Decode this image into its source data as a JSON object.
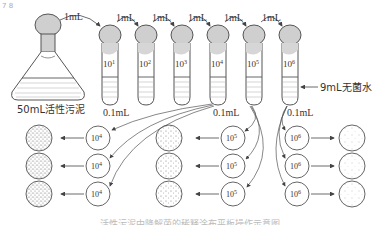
{
  "figure": {
    "corner_mark": "7 8",
    "flask": {
      "label": "50mL活性污泥"
    },
    "transfer_labels": [
      "1mL",
      "1mL",
      "1mL",
      "1mL",
      "1mL",
      "1mL"
    ],
    "tubes": [
      {
        "base": "10",
        "exp": "1"
      },
      {
        "base": "10",
        "exp": "2"
      },
      {
        "base": "10",
        "exp": "3"
      },
      {
        "base": "10",
        "exp": "4"
      },
      {
        "base": "10",
        "exp": "5"
      },
      {
        "base": "10",
        "exp": "6"
      }
    ],
    "water_label": "9mL无菌水",
    "sample_labels": [
      "0.1mL",
      "0.1mL",
      "0.1mL"
    ],
    "plate_groups": [
      {
        "base": "10",
        "exp": "4",
        "count": 3,
        "density": "high"
      },
      {
        "base": "10",
        "exp": "5",
        "count": 3,
        "density": "medium"
      },
      {
        "base": "10",
        "exp": "6",
        "count": 3,
        "density": "low"
      }
    ],
    "caption": "活性污泥中降解菌的稀释涂布平板操作示意图"
  },
  "colors": {
    "stroke": "#555555",
    "bulb_fill": "#cfcfcf",
    "liquid_line": "#888888"
  }
}
